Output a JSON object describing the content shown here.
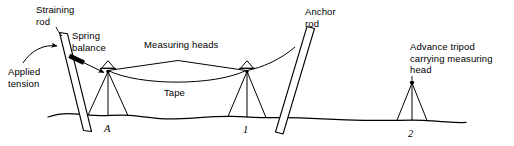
{
  "figure": {
    "type": "surveying-catenary-taping-diagram",
    "background_color": "#ffffff",
    "ink_color": "#000000"
  },
  "labels": {
    "straining_rod": "Straining\nrod",
    "spring_balance": "Spring\nbalance",
    "applied_tension": "Applied\ntension",
    "measuring_heads": "Measuring heads",
    "tape": "Tape",
    "anchor_rod": "Anchor\nrod",
    "advance_tripod": "Advance tripod\ncarrying measuring\nhead"
  },
  "stations": [
    {
      "id": "A",
      "label": "A",
      "x": 109
    },
    {
      "id": "1",
      "label": "1",
      "x": 247
    },
    {
      "id": "2",
      "label": "2",
      "x": 412
    }
  ]
}
